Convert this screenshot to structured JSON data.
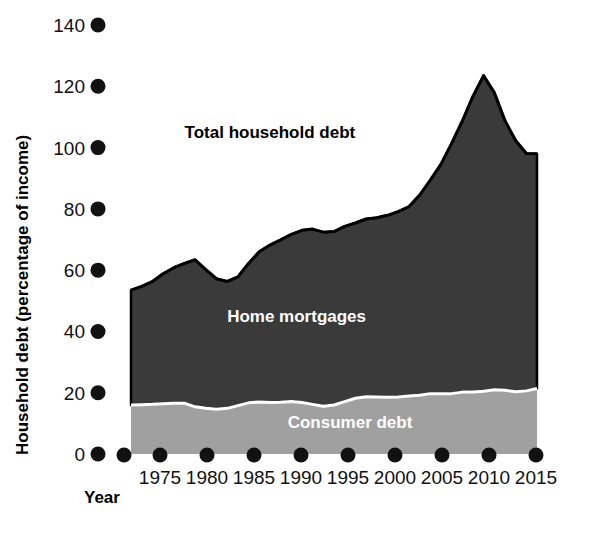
{
  "chart_data": {
    "type": "area",
    "stacked": true,
    "title": "",
    "xlabel": "Year",
    "ylabel": "Household debt (percentage of income)",
    "xlim": [
      1970,
      2015
    ],
    "ylim": [
      0,
      140
    ],
    "xticks": [
      1975,
      1980,
      1985,
      1990,
      1995,
      2000,
      2005,
      2010,
      2015
    ],
    "xtick_labels": [
      "1975",
      "1980",
      "1985",
      "1990",
      "1995",
      "2000",
      "2005",
      "2010",
      "2015"
    ],
    "yticks": [
      0,
      20,
      40,
      60,
      80,
      100,
      120,
      140
    ],
    "ytick_labels": [
      "0",
      "20",
      "40",
      "60",
      "80",
      "100",
      "120",
      "140"
    ],
    "grid": false,
    "legend": "inline-annotations",
    "annotations": [
      {
        "text": "Total household debt",
        "x": 1987.0,
        "y": 103.0,
        "color": "#000000"
      },
      {
        "text": "Home mortgages",
        "x": 1989.5,
        "y": 43.0,
        "color": "#ffffff"
      },
      {
        "text": "Consumer debt",
        "x": 1994.5,
        "y": 8.5,
        "color": "#ffffff"
      }
    ],
    "colors": {
      "consumer_debt": "#a0a0a0",
      "home_mortgages": "#3a3a3a",
      "outline": "#000000",
      "divider": "#ffffff",
      "text": "#111111"
    },
    "x": [
      1974,
      1975,
      1976,
      1977,
      1978,
      1979,
      1980,
      1981,
      1982,
      1983,
      1984,
      1985,
      1986,
      1987,
      1988,
      1989,
      1990,
      1991,
      1992,
      1993,
      1994,
      1995,
      1996,
      1997,
      1998,
      1999,
      2000,
      2001,
      2002,
      2003,
      2004,
      2005,
      2006,
      2007,
      2008,
      2009,
      2010,
      2011,
      2012
    ],
    "series": [
      {
        "name": "Consumer debt",
        "values": [
          16.0,
          16.1,
          16.2,
          16.4,
          16.6,
          16.6,
          15.4,
          14.9,
          14.6,
          14.9,
          15.8,
          16.7,
          17.0,
          16.8,
          16.9,
          17.1,
          16.8,
          16.2,
          15.6,
          16.0,
          17.1,
          18.2,
          18.7,
          18.6,
          18.5,
          18.6,
          18.9,
          19.2,
          19.7,
          19.7,
          19.7,
          20.2,
          20.2,
          20.5,
          21.0,
          20.8,
          20.3,
          20.6,
          21.4
        ]
      },
      {
        "name": "Home mortgages",
        "values": [
          37.5,
          38.6,
          40.1,
          42.4,
          44.2,
          45.6,
          48.0,
          45.3,
          42.6,
          41.4,
          42.0,
          45.5,
          49.0,
          51.4,
          53.0,
          54.6,
          56.2,
          57.2,
          56.8,
          56.6,
          57.2,
          57.2,
          58.0,
          58.5,
          59.4,
          60.5,
          61.8,
          65.2,
          69.6,
          74.8,
          81.6,
          88.4,
          96.5,
          103.0,
          97.0,
          88.0,
          82.0,
          77.5,
          76.6
        ]
      }
    ],
    "total": {
      "name": "Total household debt",
      "values": [
        53.5,
        54.7,
        56.3,
        58.8,
        60.8,
        62.2,
        63.4,
        60.2,
        57.2,
        56.3,
        57.8,
        62.2,
        66.0,
        68.2,
        69.9,
        71.7,
        73.0,
        73.4,
        72.4,
        72.6,
        74.3,
        75.4,
        76.7,
        77.1,
        77.9,
        79.1,
        80.7,
        84.4,
        89.3,
        94.5,
        101.3,
        108.6,
        116.7,
        123.5,
        118.0,
        108.8,
        102.3,
        98.1,
        98.0
      ]
    }
  },
  "geometry": {
    "plot_left": 131,
    "plot_right": 537,
    "plot_bottom": 454,
    "y_zero_px": 454,
    "y_per_unit_px": 3.064,
    "x_axis_dot_y": 455,
    "y_axis_dot_x": 98,
    "extra_origin_dot": true,
    "xtick_px": [
      160,
      207,
      254,
      301,
      348,
      395,
      442,
      489,
      536
    ]
  }
}
